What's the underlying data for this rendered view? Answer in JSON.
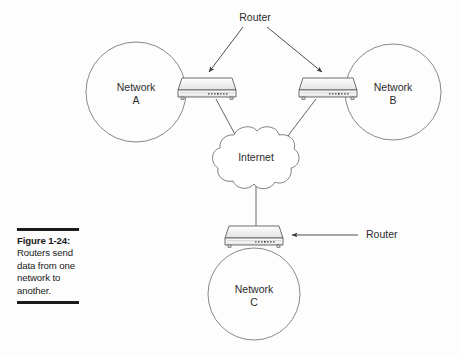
{
  "figure": {
    "caption_title": "Figure 1-24:",
    "caption_body": "Routers send data from one network to another.",
    "background_color": "#fdfdfd",
    "line_color": "#4a4a4a",
    "text_color": "#2b2b2b"
  },
  "diagram": {
    "type": "network-topology",
    "nodes": [
      {
        "id": "network-a",
        "kind": "cloud-circle",
        "label_line1": "Network",
        "label_line2": "A",
        "cx": 136,
        "cy": 92,
        "r": 50
      },
      {
        "id": "network-b",
        "kind": "cloud-circle",
        "label_line1": "Network",
        "label_line2": "B",
        "cx": 393,
        "cy": 92,
        "r": 48
      },
      {
        "id": "network-c",
        "kind": "cloud-circle",
        "label_line1": "Network",
        "label_line2": "C",
        "cx": 254,
        "cy": 294,
        "r": 46
      },
      {
        "id": "internet-cloud",
        "kind": "cloud",
        "label": "Internet",
        "cx": 256,
        "cy": 158
      },
      {
        "id": "router-left",
        "kind": "router-device",
        "x": 175,
        "y": 78
      },
      {
        "id": "router-right",
        "kind": "router-device",
        "x": 296,
        "y": 78
      },
      {
        "id": "router-bottom",
        "kind": "router-device",
        "x": 222,
        "y": 226
      }
    ],
    "links": [
      {
        "from": "router-left",
        "to": "internet-cloud"
      },
      {
        "from": "router-right",
        "to": "internet-cloud"
      },
      {
        "from": "internet-cloud",
        "to": "router-bottom"
      }
    ],
    "annotations": [
      {
        "id": "router-callout-top",
        "text": "Router",
        "x": 255,
        "y": 18,
        "arrows": 2
      },
      {
        "id": "router-callout-bottom",
        "text": "Router",
        "x": 366,
        "y": 235,
        "arrows": 1
      }
    ]
  }
}
